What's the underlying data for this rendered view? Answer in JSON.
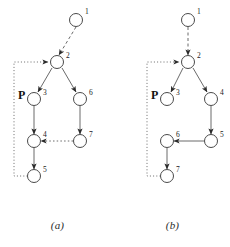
{
  "figure": {
    "panels": [
      {
        "id": "a",
        "caption": "(a)",
        "p_label": "P",
        "nodes": [
          {
            "id": "1",
            "label": "1",
            "x": 76,
            "y": 20
          },
          {
            "id": "2",
            "label": "2",
            "x": 57,
            "y": 62
          },
          {
            "id": "3",
            "label": "3",
            "x": 34,
            "y": 99
          },
          {
            "id": "6",
            "label": "6",
            "x": 80,
            "y": 99
          },
          {
            "id": "4",
            "label": "4",
            "x": 34,
            "y": 141
          },
          {
            "id": "7",
            "label": "7",
            "x": 80,
            "y": 141
          },
          {
            "id": "5",
            "label": "5",
            "x": 34,
            "y": 176
          }
        ],
        "edges": [
          {
            "from": "1",
            "to": "2",
            "style": "dashed"
          },
          {
            "from": "2",
            "to": "3",
            "style": "solid"
          },
          {
            "from": "2",
            "to": "6",
            "style": "solid"
          },
          {
            "from": "3",
            "to": "4",
            "style": "solid"
          },
          {
            "from": "6",
            "to": "7",
            "style": "solid"
          },
          {
            "from": "7",
            "to": "4",
            "style": "dotted"
          },
          {
            "from": "4",
            "to": "5",
            "style": "solid"
          },
          {
            "from": "5",
            "to": "2",
            "style": "dotted-feedback"
          }
        ]
      },
      {
        "id": "b",
        "caption": "(b)",
        "p_label": "P",
        "nodes": [
          {
            "id": "1",
            "label": "1",
            "x": 73,
            "y": 20
          },
          {
            "id": "2",
            "label": "2",
            "x": 73,
            "y": 62
          },
          {
            "id": "3",
            "label": "3",
            "x": 52,
            "y": 99
          },
          {
            "id": "4",
            "label": "4",
            "x": 96,
            "y": 99
          },
          {
            "id": "5",
            "label": "5",
            "x": 96,
            "y": 141
          },
          {
            "id": "6",
            "label": "6",
            "x": 52,
            "y": 141
          },
          {
            "id": "7",
            "label": "7",
            "x": 52,
            "y": 176
          }
        ],
        "edges": [
          {
            "from": "1",
            "to": "2",
            "style": "dashed"
          },
          {
            "from": "2",
            "to": "3",
            "style": "solid"
          },
          {
            "from": "2",
            "to": "4",
            "style": "solid"
          },
          {
            "from": "4",
            "to": "5",
            "style": "solid"
          },
          {
            "from": "5",
            "to": "6",
            "style": "solid"
          },
          {
            "from": "6",
            "to": "7",
            "style": "solid"
          },
          {
            "from": "7",
            "to": "2",
            "style": "dotted-feedback"
          }
        ]
      }
    ],
    "colors": {
      "stroke": "#4a4a4a",
      "node_fill": "#ffffff",
      "text": "#1a1a1a",
      "background": "#ffffff"
    }
  }
}
